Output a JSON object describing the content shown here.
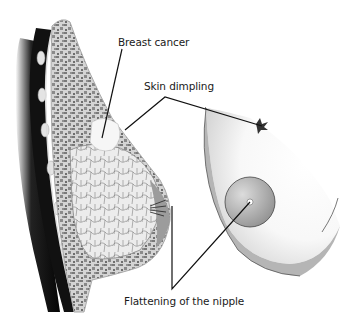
{
  "labels": {
    "breast_cancer": "Breast cancer",
    "skin_dimpling": "Skin dimpling",
    "nipple_flattening": "Flattening of the nipple"
  },
  "panels": {
    "left": "Breast cross-section (sagittal view)",
    "right": "Breast external view"
  },
  "colors": {
    "background": "#ffffff",
    "line": "#111111",
    "muscle": "#0d0d0d",
    "fat_tissue": "#8c8c8c",
    "gland_tissue": "#e8e8e8",
    "skin_shade": "#a8a8a8",
    "areola": "#9a9a9a"
  }
}
